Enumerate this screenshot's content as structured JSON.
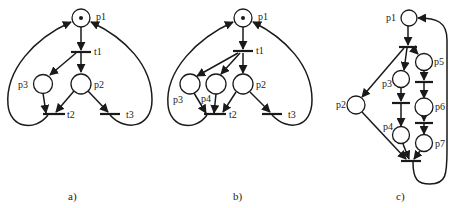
{
  "figure": {
    "panels": [
      {
        "id": "a",
        "caption": "a)",
        "places": [
          {
            "label": "p1",
            "tokens": 1
          },
          {
            "label": "p2",
            "tokens": 0
          },
          {
            "label": "p3",
            "tokens": 0
          }
        ],
        "transitions": [
          "t1",
          "t2",
          "t3"
        ],
        "arcs": [
          [
            "p1",
            "t1"
          ],
          [
            "t1",
            "p3"
          ],
          [
            "t1",
            "p2"
          ],
          [
            "p3",
            "t2"
          ],
          [
            "p2",
            "t2"
          ],
          [
            "p2",
            "t3"
          ],
          [
            "t2",
            "p1"
          ],
          [
            "t3",
            "p1"
          ]
        ]
      },
      {
        "id": "b",
        "caption": "b)",
        "places": [
          {
            "label": "p1",
            "tokens": 1
          },
          {
            "label": "p2",
            "tokens": 0
          },
          {
            "label": "p3",
            "tokens": 0
          },
          {
            "label": "p4",
            "tokens": 0
          }
        ],
        "transitions": [
          "t1",
          "t2",
          "t3"
        ],
        "arcs": [
          [
            "p1",
            "t1"
          ],
          [
            "t1",
            "p3"
          ],
          [
            "t1",
            "p4"
          ],
          [
            "t1",
            "p2"
          ],
          [
            "p3",
            "t2"
          ],
          [
            "p4",
            "t2"
          ],
          [
            "p2",
            "t2"
          ],
          [
            "p2",
            "t3"
          ],
          [
            "t2",
            "p1"
          ],
          [
            "t3",
            "p1"
          ]
        ]
      },
      {
        "id": "c",
        "caption": "c)",
        "places": [
          {
            "label": "p1",
            "tokens": 0
          },
          {
            "label": "p2",
            "tokens": 0
          },
          {
            "label": "p3",
            "tokens": 0
          },
          {
            "label": "p4",
            "tokens": 0
          },
          {
            "label": "p5",
            "tokens": 0
          },
          {
            "label": "p6",
            "tokens": 0
          },
          {
            "label": "p7",
            "tokens": 0
          }
        ],
        "transitions": [
          "",
          "",
          "",
          "",
          ""
        ],
        "arcs": [
          [
            "p1",
            "t_fork"
          ],
          [
            "t_fork",
            "p2"
          ],
          [
            "t_fork",
            "p3"
          ],
          [
            "t_fork",
            "p5"
          ],
          [
            "p3",
            "t_a"
          ],
          [
            "t_a",
            "p4"
          ],
          [
            "p5",
            "t_b"
          ],
          [
            "t_b",
            "p6"
          ],
          [
            "p6",
            "t_c"
          ],
          [
            "t_c",
            "p7"
          ],
          [
            "p2",
            "t_join"
          ],
          [
            "p4",
            "t_join"
          ],
          [
            "p7",
            "t_join"
          ],
          [
            "t_join",
            "p1"
          ]
        ]
      }
    ]
  },
  "labels": {
    "a": {
      "p1": "p1",
      "p2": "p2",
      "p3": "p3",
      "t1": "t1",
      "t2": "t2",
      "t3": "t3",
      "caption": "a)"
    },
    "b": {
      "p1": "p1",
      "p2": "p2",
      "p3": "p3",
      "p4": "p4",
      "t1": "t1",
      "t2": "t2",
      "t3": "t3",
      "caption": "b)"
    },
    "c": {
      "p1": "p1",
      "p2": "p2",
      "p3": "p3",
      "p4": "p4",
      "p5": "p5",
      "p6": "p6",
      "p7": "p7",
      "caption": "c)"
    }
  },
  "colors": {
    "ink": "#1a1a1a",
    "background": "#ffffff"
  }
}
